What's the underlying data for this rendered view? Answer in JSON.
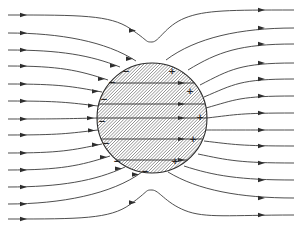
{
  "diagram": {
    "colors": {
      "line": "#3a3a3a",
      "background": "#ffffff",
      "hatch": "#4a4a4a"
    },
    "sphere": {
      "cx": 152,
      "cy": 118,
      "r": 55,
      "hatched": true
    },
    "field_lines": [
      {
        "y_left": 15,
        "y_right": 10,
        "mid_y": 42,
        "enters_sphere": false,
        "arrows": [
          24,
          133,
          262
        ]
      },
      {
        "y_left": 33,
        "y_right": 28,
        "enters_sphere": true,
        "entry": [
          136,
          61
        ],
        "exit": [
          166,
          60
        ],
        "arrows": [
          24,
          262
        ]
      },
      {
        "y_left": 50,
        "y_right": 44,
        "enters_sphere": true,
        "entry": [
          120,
          67
        ],
        "exit": [
          188,
          70
        ],
        "arrows": [
          24,
          262
        ]
      },
      {
        "y_left": 66,
        "y_right": 63,
        "enters_sphere": true,
        "entry": [
          108,
          80
        ],
        "exit": [
          200,
          85
        ],
        "arrows": [
          24,
          262
        ]
      },
      {
        "y_left": 84,
        "y_right": 79,
        "enters_sphere": true,
        "entry": [
          102,
          92
        ],
        "exit": [
          204,
          97
        ],
        "arrows": [
          24,
          262
        ]
      },
      {
        "y_left": 101,
        "y_right": 96,
        "enters_sphere": true,
        "entry": [
          98,
          106
        ],
        "exit": [
          206,
          108
        ],
        "arrows": [
          24,
          262
        ]
      },
      {
        "y_left": 119,
        "y_right": 113,
        "enters_sphere": true,
        "entry": [
          97,
          118
        ],
        "exit": [
          207,
          118
        ],
        "arrows": [
          24,
          262
        ]
      },
      {
        "y_left": 135,
        "y_right": 130,
        "enters_sphere": true,
        "entry": [
          98,
          130
        ],
        "exit": [
          206,
          130
        ],
        "arrows": [
          24,
          262
        ]
      },
      {
        "y_left": 153,
        "y_right": 146,
        "enters_sphere": true,
        "entry": [
          102,
          144
        ],
        "exit": [
          204,
          141
        ],
        "arrows": [
          24,
          262
        ]
      },
      {
        "y_left": 170,
        "y_right": 163,
        "enters_sphere": true,
        "entry": [
          110,
          156
        ],
        "exit": [
          198,
          154
        ],
        "arrows": [
          24,
          262
        ]
      },
      {
        "y_left": 187,
        "y_right": 180,
        "enters_sphere": true,
        "entry": [
          125,
          167
        ],
        "exit": [
          184,
          166
        ],
        "arrows": [
          24,
          262
        ]
      },
      {
        "y_left": 204,
        "y_right": 198,
        "enters_sphere": true,
        "entry": [
          142,
          172
        ],
        "exit": [
          168,
          172
        ],
        "arrows": [
          24,
          262
        ]
      },
      {
        "y_left": 219,
        "y_right": 215,
        "mid_y": 190,
        "enters_sphere": false,
        "arrows": [
          24,
          133,
          262
        ]
      }
    ],
    "charges": {
      "negative": [
        {
          "x": 126,
          "y": 71,
          "label": "−"
        },
        {
          "x": 112,
          "y": 82,
          "label": "−"
        },
        {
          "x": 104,
          "y": 99,
          "label": "−"
        },
        {
          "x": 102,
          "y": 121,
          "label": "−"
        },
        {
          "x": 106,
          "y": 143,
          "label": "−"
        },
        {
          "x": 117,
          "y": 161,
          "label": "−"
        },
        {
          "x": 145,
          "y": 171,
          "label": "−"
        }
      ],
      "positive": [
        {
          "x": 172,
          "y": 71,
          "label": "+"
        },
        {
          "x": 190,
          "y": 91,
          "label": "+"
        },
        {
          "x": 200,
          "y": 117,
          "label": "+"
        },
        {
          "x": 193,
          "y": 139,
          "label": "+"
        },
        {
          "x": 175,
          "y": 161,
          "label": "+"
        }
      ]
    }
  }
}
